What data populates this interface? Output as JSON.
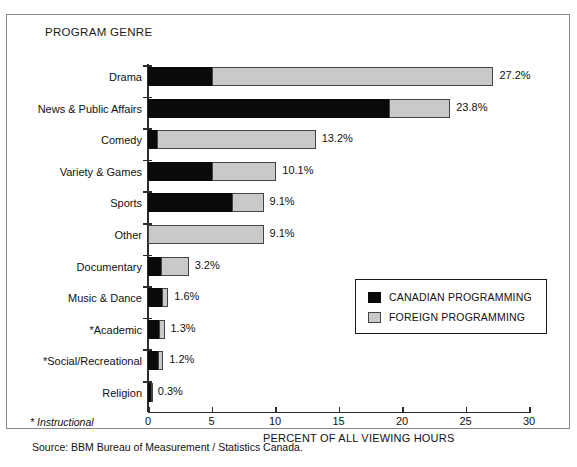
{
  "chart_data": {
    "type": "bar",
    "orientation": "horizontal",
    "stacked": true,
    "title": "PROGRAM GENRE",
    "xlabel": "PERCENT OF ALL VIEWING HOURS",
    "ylabel": "",
    "xlim": [
      0,
      30
    ],
    "xticks": [
      0,
      5,
      10,
      15,
      20,
      25,
      30
    ],
    "grid": false,
    "legend_position": "lower-right inside plot",
    "categories": [
      "Drama",
      "News & Public Affairs",
      "Comedy",
      "Variety & Games",
      "Sports",
      "Other",
      "Documentary",
      "Music & Dance",
      "*Academic",
      "*Social/Recreational",
      "Religion"
    ],
    "series": [
      {
        "name": "CANADIAN PROGRAMMING",
        "color": "#0a0a0a",
        "values": [
          5.0,
          19.0,
          0.7,
          5.0,
          6.6,
          0.0,
          1.0,
          1.1,
          0.9,
          0.8,
          0.2
        ]
      },
      {
        "name": "FOREIGN PROGRAMMING",
        "color": "#c9c9c9",
        "values": [
          22.2,
          4.8,
          12.5,
          5.1,
          2.5,
          9.1,
          2.2,
          0.5,
          0.4,
          0.4,
          0.1
        ]
      }
    ],
    "totals": [
      27.2,
      23.8,
      13.2,
      10.1,
      9.1,
      9.1,
      3.2,
      1.6,
      1.3,
      1.2,
      0.3
    ],
    "data_labels": [
      "27.2%",
      "23.8%",
      "13.2%",
      "10.1%",
      "9.1%",
      "9.1%",
      "3.2%",
      "1.6%",
      "1.3%",
      "1.2%",
      "0.3%"
    ],
    "footnote": "* Instructional",
    "source": "Source: BBM Bureau of Measurement / Statistics Canada."
  },
  "legend": {
    "items": [
      {
        "label": "CANADIAN PROGRAMMING",
        "swatch": "canadian"
      },
      {
        "label": "FOREIGN PROGRAMMING",
        "swatch": "foreign"
      }
    ]
  }
}
